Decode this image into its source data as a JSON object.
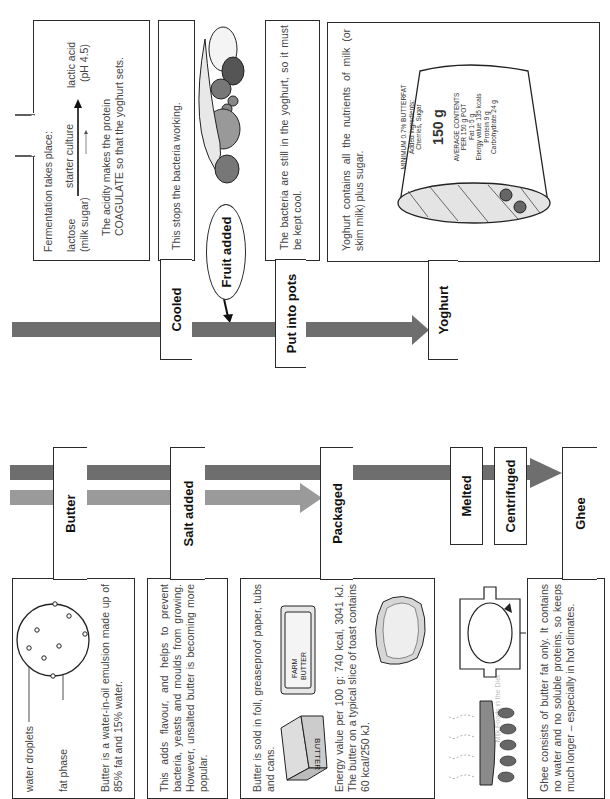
{
  "header": {
    "running_title": "Milk Foods in the Diet"
  },
  "yoghurt_flow": {
    "fermentation": {
      "title": "Fermentation takes place:",
      "reactant": "lactose",
      "reactant_note": "(milk sugar)",
      "catalyst": "starter culture",
      "product": "lactic acid",
      "product_note": "(pH 4.5)",
      "line1": "The acidity makes the protein",
      "line2": "COAGULATE so that the yoghurt sets."
    },
    "cooled": {
      "label": "Cooled",
      "text": "This stops the bacteria working."
    },
    "fruit_added": {
      "label": "Fruit added"
    },
    "put_into_pots": {
      "label": "Put into pots",
      "text": "The bacteria are still in the yoghurt, so it must be kept cool."
    },
    "yoghurt": {
      "label": "Yoghurt",
      "text": "Yoghurt contains all the nutrients of milk (or skim milk) plus sugar.",
      "pot": {
        "line1": "MINIMUM 0.7% BUTTERFAT",
        "line2": "Added ingredients:",
        "line3": "Cherries, Sugar",
        "weight": "150 g",
        "contents_title": "AVERAGE CONTENTS",
        "contents_per": "PER 150 g POT",
        "fat": "Fat 1·5 g",
        "energy": "Energy value 135 kcals",
        "protein": "Protein 9 g",
        "carbohydrate": "Carbohydrate 24 g"
      }
    }
  },
  "butter_flow": {
    "butter": {
      "label": "Butter",
      "diagram_label_1": "water droplets",
      "diagram_label_2": "fat phase",
      "text": "Butter is a water-in-oil emulsion made up of 85% fat and 15% water."
    },
    "salt_added": {
      "label": "Salt added",
      "text": "This adds flavour, and helps to prevent bacteria, yeasts and moulds from growing. However, unsalted butter is becoming more popular."
    },
    "packaged": {
      "label": "Packaged",
      "text1": "Butter is sold in foil, greaseproof paper, tubs and cans.",
      "text2": "Energy value per 100 g: 740 kcal, 3041 kJ. The butter on a typical slice of toast contains 60 kcal/250 kJ.",
      "pack1_label": "BUTTER",
      "pack2_label": "FARM BUTTER"
    },
    "melted": {
      "label": "Melted"
    },
    "centrifuged": {
      "label": "Centrifuged"
    },
    "ghee": {
      "label": "Ghee",
      "text": "Ghee consists of butter fat only. It contains no water and no soluble proteins, so keeps much longer – especially in hot climates."
    }
  },
  "colors": {
    "bar_dark": "#6e6e6e",
    "bar_light": "#9a9a9a",
    "outline": "#2a2a2a",
    "text": "#444444"
  }
}
